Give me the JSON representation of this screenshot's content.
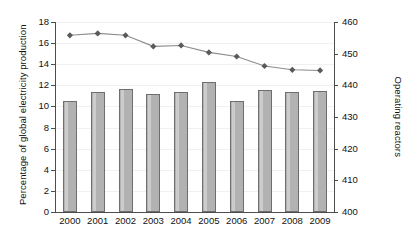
{
  "chart_data": {
    "type": "bar",
    "title": "",
    "xlabel": "",
    "ylabel": "Percentage of global electricity production",
    "y2label": "Operating reactors",
    "grid": true,
    "legend": "none",
    "categories": [
      "2000",
      "2001",
      "2002",
      "2003",
      "2004",
      "2005",
      "2006",
      "2007",
      "2008",
      "2009"
    ],
    "ylim": [
      0,
      18
    ],
    "yticks": [
      0,
      2,
      4,
      6,
      8,
      10,
      12,
      14,
      16,
      18
    ],
    "y2lim": [
      400,
      460
    ],
    "y2ticks": [
      400,
      410,
      420,
      430,
      440,
      450,
      460
    ],
    "series": [
      {
        "name": "Percentage of global electricity production",
        "type": "bar",
        "axis": "left",
        "color": "#b2b2b2",
        "edge_color": "#6e6e6e",
        "values": [
          10.5,
          11.4,
          11.7,
          11.2,
          11.4,
          12.3,
          10.5,
          11.6,
          11.4,
          11.5
        ]
      },
      {
        "name": "Operating reactors",
        "type": "line",
        "axis": "right",
        "color": "#8c8c8c",
        "marker": "diamond",
        "marker_color": "#5a5a5a",
        "values": [
          455.8,
          456.4,
          455.8,
          452.3,
          452.6,
          450.4,
          449.1,
          446.1,
          444.9,
          444.7
        ]
      }
    ]
  },
  "axes": {
    "left_title": "Percentage of global electricity production",
    "right_title": "Operating reactors"
  }
}
